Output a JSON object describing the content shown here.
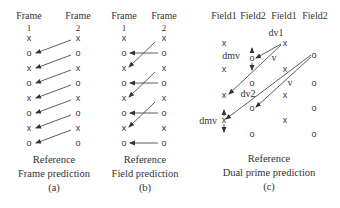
{
  "panel_a": {
    "headers": [
      "Frame",
      "Frame"
    ],
    "numbers": [
      "1",
      "2"
    ],
    "marks_left": [
      "x",
      "o",
      "x",
      "o",
      "x",
      "o",
      "x",
      "o"
    ],
    "marks_right": [
      "x",
      "o",
      "x",
      "o",
      "x",
      "o",
      "x",
      "o"
    ],
    "caption_line1": "Reference",
    "caption_line2": "Frame prediction",
    "caption_line3": "(a)"
  },
  "panel_b": {
    "headers": [
      "Frame",
      "Frame"
    ],
    "numbers": [
      "1",
      "2"
    ],
    "marks_left": [
      "x",
      "o",
      "x",
      "o",
      "x",
      "o",
      "x",
      "o"
    ],
    "marks_right": [
      "x",
      "o",
      "x",
      "o",
      "x",
      "o",
      "x",
      "o"
    ],
    "caption_line1": "Reference",
    "caption_line2": "Field prediction",
    "caption_line3": "(b)"
  },
  "panel_c": {
    "headers": [
      "Field1",
      "Field2",
      "Field1",
      "Field2"
    ],
    "labels": {
      "dv1": "dv1",
      "dv2": "dv2",
      "dmv_top": "dmv",
      "dmv_bottom": "dmv",
      "v1": "v",
      "v2": "v"
    },
    "col1_marks": [
      "x",
      "x",
      "x",
      "x"
    ],
    "col2_marks": [
      "o",
      "o",
      "o",
      "o"
    ],
    "col3_marks": [
      "x",
      "x",
      "x",
      "x"
    ],
    "col4_marks": [
      "o",
      "o",
      "o",
      "o"
    ],
    "caption_line1": "Reference",
    "caption_line2": "Dual prime prediction",
    "caption_line3": "(c)"
  }
}
